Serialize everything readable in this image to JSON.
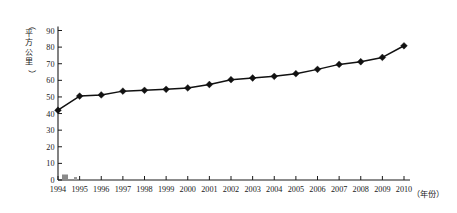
{
  "chart_data": {
    "type": "line",
    "title": "",
    "subtitle": "",
    "xlabel": "（年份）",
    "ylabel": "（平方公里）",
    "ylim": [
      0,
      90
    ],
    "ytick_step": 10,
    "yticks": [
      0,
      10,
      20,
      30,
      40,
      50,
      60,
      70,
      80,
      90
    ],
    "grid": false,
    "legend": "none",
    "marker": "diamond",
    "line_color": "#111111",
    "categories": [
      "1994",
      "1995",
      "1996",
      "1997",
      "1998",
      "1999",
      "2000",
      "2001",
      "2002",
      "2003",
      "2004",
      "2005",
      "2006",
      "2007",
      "2008",
      "2009",
      "2010"
    ],
    "x": [
      1994,
      1995,
      1996,
      1997,
      1998,
      1999,
      2000,
      2001,
      2002,
      2003,
      2004,
      2005,
      2006,
      2007,
      2008,
      2009,
      2010
    ],
    "values": [
      42.0,
      50.5,
      51.2,
      53.5,
      54.0,
      54.6,
      55.4,
      57.5,
      60.4,
      61.4,
      62.4,
      64.0,
      66.6,
      69.6,
      71.2,
      73.8,
      80.8
    ],
    "series": [
      {
        "name": "面积",
        "values": [
          42.0,
          50.5,
          51.2,
          53.5,
          54.0,
          54.6,
          55.4,
          57.5,
          60.4,
          61.4,
          62.4,
          64.0,
          66.6,
          69.6,
          71.2,
          73.8,
          80.8
        ]
      }
    ],
    "annotations": []
  },
  "axes": {
    "y_unit_label": "（平方公里）",
    "x_unit_label": "（年份）"
  }
}
